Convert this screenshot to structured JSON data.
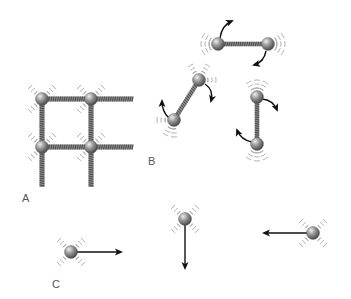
{
  "figure": {
    "panels": [
      {
        "id": "A",
        "label": "A",
        "label_pos": [
          22,
          200
        ],
        "description": "solid lattice: atoms connected by springs vibrating in place",
        "atoms": [
          [
            42,
            99
          ],
          [
            91,
            99
          ],
          [
            42,
            147
          ],
          [
            91,
            147
          ]
        ],
        "springs_h": [
          [
            42,
            99,
            133,
            99
          ],
          [
            91,
            99,
            133,
            99
          ],
          [
            42,
            147,
            133,
            147
          ],
          [
            91,
            147,
            133,
            147
          ]
        ],
        "springs_v": [
          [
            42,
            99,
            42,
            187
          ],
          [
            91,
            99,
            91,
            187
          ],
          [
            42,
            147,
            42,
            187
          ],
          [
            91,
            147,
            91,
            187
          ]
        ]
      },
      {
        "id": "B",
        "label": "B",
        "label_pos": [
          148,
          164
        ],
        "description": "diatomic molecules with springs rotating and vibrating",
        "molecules": [
          {
            "a": [
              218,
              44
            ],
            "b": [
              268,
              44
            ]
          },
          {
            "a": [
              199,
              80
            ],
            "b": [
              174,
              120
            ]
          },
          {
            "a": [
              257,
              97
            ],
            "b": [
              257,
              144
            ]
          }
        ]
      },
      {
        "id": "C",
        "label": "C",
        "label_pos": [
          52,
          287
        ],
        "description": "free atoms moving with translational velocity arrows",
        "atoms": [
          {
            "pos": [
              71,
              252
            ],
            "arrow_to": [
              121,
              252
            ]
          },
          {
            "pos": [
              185,
              219
            ],
            "arrow_to": [
              185,
              268
            ]
          },
          {
            "pos": [
              313,
              233
            ],
            "arrow_to": [
              264,
              233
            ]
          }
        ]
      }
    ],
    "colors": {
      "atom_light": "#e0e0e0",
      "atom_dark": "#555555",
      "spring": "#666666",
      "arrow": "#111111",
      "wave": "#999999",
      "label": "#555555"
    }
  }
}
